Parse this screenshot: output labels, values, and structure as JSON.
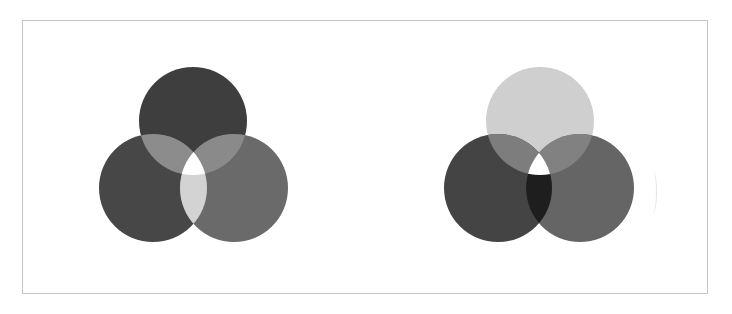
{
  "figure": {
    "diagrams": [
      {
        "id": "additive",
        "circles": [
          {
            "name": "top",
            "cx": 193,
            "cy": 121,
            "r": 54,
            "fill": "#3e3e3e"
          },
          {
            "name": "left",
            "cx": 153,
            "cy": 188,
            "r": 54,
            "fill": "#474747"
          },
          {
            "name": "right",
            "cx": 234,
            "cy": 188,
            "r": 54,
            "fill": "#6a6a6a"
          }
        ],
        "overlaps": {
          "top_left": "#8c8c8c",
          "top_right": "#8a8a8a",
          "left_right": "#d3d3d3",
          "center": "#ffffff"
        }
      },
      {
        "id": "subtractive",
        "circles": [
          {
            "name": "top",
            "cx": 540,
            "cy": 121,
            "r": 54,
            "fill": "#cfcfcf"
          },
          {
            "name": "left",
            "cx": 498,
            "cy": 188,
            "r": 54,
            "fill": "#444444"
          },
          {
            "name": "right",
            "cx": 580,
            "cy": 188,
            "r": 54,
            "fill": "#656565"
          }
        ],
        "overlaps": {
          "top_left": "#7d7d7d",
          "top_right": "#818181",
          "left_right": "#1e1e1e",
          "center": "#ffffff"
        }
      }
    ],
    "colors": {
      "background": "#ffffff",
      "frame_border": "#c4c4c4"
    }
  }
}
